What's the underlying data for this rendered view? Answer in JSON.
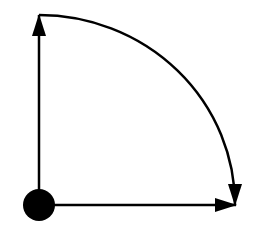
{
  "diagram": {
    "type": "quarter-circle-arc-with-axes",
    "colors": {
      "background": "#ffffff",
      "stroke": "#000000",
      "fill": "#000000"
    },
    "origin": {
      "x": 39,
      "y": 205,
      "r": 16
    },
    "vertical_arrow": {
      "x1": 39,
      "y1": 205,
      "x2": 39,
      "y2": 15
    },
    "horizontal_arrow": {
      "x1": 39,
      "y1": 205,
      "x2": 236,
      "y2": 205
    },
    "arc": {
      "start": [
        39,
        15
      ],
      "end": [
        235,
        205
      ],
      "radius": 196
    }
  }
}
